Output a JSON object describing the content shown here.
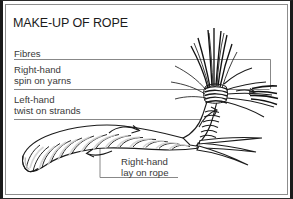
{
  "figure": {
    "title": "MAKE-UP OF ROPE",
    "background_color": "#ffffff",
    "ink_color": "#1b1b1b",
    "label_color": "#3a3a3a",
    "leader_line_color": "#7b7b7b",
    "frame": {
      "outer_border_color": "#1a1a1a",
      "inner_border_color": "#8d8d8d"
    }
  },
  "labels": {
    "fibres": {
      "line1": "Fibres",
      "line2": ""
    },
    "right_hand_spin": {
      "line1": "Right-hand",
      "line2": "spin on yarns"
    },
    "left_hand_twist": {
      "line1": "Left-hand",
      "line2": "twist on strands"
    },
    "right_hand_lay": {
      "line1": "Right-hand",
      "line2": "lay on rope"
    }
  },
  "diagram_parts": [
    "unlaid-fibres",
    "spun-yarns",
    "twisted-strands",
    "laid-rope",
    "twist-direction-arrows"
  ]
}
